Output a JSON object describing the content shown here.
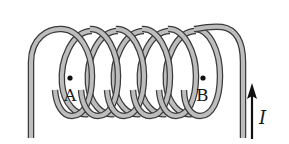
{
  "diagram": {
    "type": "solenoid",
    "turns": 6,
    "points": [
      {
        "label": "A",
        "position": "inside left end of coil"
      },
      {
        "label": "B",
        "position": "inside right end of coil"
      }
    ],
    "current": {
      "label": "I",
      "direction": "up",
      "location": "right lead wire"
    },
    "colors": {
      "wire_outline": "#3a3a3a",
      "wire_fill": "#bdbdbd",
      "arrow": "#111111",
      "background": "#ffffff"
    }
  },
  "labels": {
    "point_a": "A",
    "point_b": "B",
    "current": "I"
  }
}
